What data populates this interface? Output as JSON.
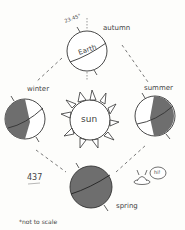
{
  "diagram": {
    "center_label": "sun",
    "earth_label": "Earth",
    "tilt_label": "23.45°",
    "seasons": [
      {
        "name": "autumn",
        "position": "top"
      },
      {
        "name": "winter",
        "position": "left"
      },
      {
        "name": "summer",
        "position": "right"
      },
      {
        "name": "spring",
        "position": "bottom"
      }
    ],
    "page_number": "437",
    "footnote": "*not to scale",
    "alien_speech": "hi!",
    "colors": {
      "ink": "#333333",
      "shade": "#6e6e6e",
      "paper": "#fdfdfb"
    }
  }
}
